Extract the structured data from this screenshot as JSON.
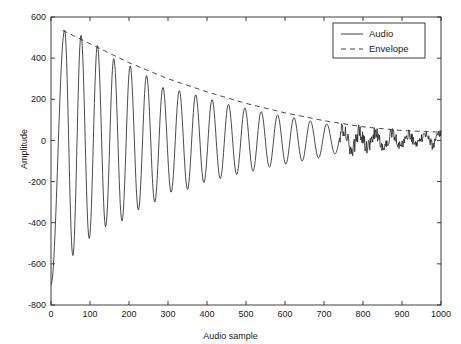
{
  "chart_data": {
    "type": "line",
    "title": "",
    "xlabel": "Audio sample",
    "ylabel": "Amplitude",
    "xlim": [
      0,
      1000
    ],
    "ylim": [
      -800,
      600
    ],
    "xticks": [
      0,
      100,
      200,
      300,
      400,
      500,
      600,
      700,
      800,
      900,
      1000
    ],
    "yticks": [
      -800,
      -600,
      -400,
      -200,
      0,
      200,
      400,
      600
    ],
    "grid": false,
    "legend_position": "upper right",
    "series": [
      {
        "name": "Audio",
        "style": "solid",
        "color": "#2a2a2a",
        "description": "Exponentially damped oscillation, period about 42 samples, starting near -700 at sample 0, first positive peak about 535 near sample 35, decaying to a low-amplitude noisy tail of roughly plus/minus 30 after sample 760",
        "peaks": [
          {
            "x": 35,
            "y": 535
          },
          {
            "x": 77,
            "y": 512
          },
          {
            "x": 119,
            "y": 462
          },
          {
            "x": 161,
            "y": 398
          },
          {
            "x": 203,
            "y": 363
          },
          {
            "x": 245,
            "y": 315
          },
          {
            "x": 287,
            "y": 258
          },
          {
            "x": 329,
            "y": 242
          },
          {
            "x": 371,
            "y": 222
          },
          {
            "x": 413,
            "y": 198
          },
          {
            "x": 455,
            "y": 175
          },
          {
            "x": 497,
            "y": 158
          },
          {
            "x": 539,
            "y": 140
          },
          {
            "x": 581,
            "y": 124
          },
          {
            "x": 623,
            "y": 110
          },
          {
            "x": 665,
            "y": 95
          },
          {
            "x": 707,
            "y": 80
          },
          {
            "x": 749,
            "y": 62
          },
          {
            "x": 791,
            "y": 40
          },
          {
            "x": 833,
            "y": 35
          },
          {
            "x": 875,
            "y": 32
          },
          {
            "x": 917,
            "y": 30
          },
          {
            "x": 959,
            "y": 34
          },
          {
            "x": 995,
            "y": 40
          }
        ],
        "troughs": [
          {
            "x": 0,
            "y": -700
          },
          {
            "x": 56,
            "y": -560
          },
          {
            "x": 98,
            "y": -478
          },
          {
            "x": 140,
            "y": -420
          },
          {
            "x": 182,
            "y": -392
          },
          {
            "x": 224,
            "y": -338
          },
          {
            "x": 266,
            "y": -300
          },
          {
            "x": 308,
            "y": -252
          },
          {
            "x": 350,
            "y": -238
          },
          {
            "x": 392,
            "y": -205
          },
          {
            "x": 434,
            "y": -185
          },
          {
            "x": 476,
            "y": -165
          },
          {
            "x": 518,
            "y": -148
          },
          {
            "x": 560,
            "y": -130
          },
          {
            "x": 602,
            "y": -115
          },
          {
            "x": 644,
            "y": -100
          },
          {
            "x": 686,
            "y": -85
          },
          {
            "x": 728,
            "y": -66
          },
          {
            "x": 770,
            "y": -48
          },
          {
            "x": 812,
            "y": -34
          },
          {
            "x": 854,
            "y": -30
          },
          {
            "x": 896,
            "y": -28
          },
          {
            "x": 938,
            "y": -26
          },
          {
            "x": 980,
            "y": -24
          }
        ]
      },
      {
        "name": "Envelope",
        "style": "dashed",
        "color": "#2a2a2a",
        "description": "Smooth exponential decay curve tracing the positive peaks of the audio signal",
        "points": [
          {
            "x": 30,
            "y": 535
          },
          {
            "x": 100,
            "y": 470
          },
          {
            "x": 200,
            "y": 378
          },
          {
            "x": 300,
            "y": 300
          },
          {
            "x": 400,
            "y": 236
          },
          {
            "x": 500,
            "y": 180
          },
          {
            "x": 600,
            "y": 134
          },
          {
            "x": 700,
            "y": 96
          },
          {
            "x": 800,
            "y": 66
          },
          {
            "x": 900,
            "y": 48
          },
          {
            "x": 1000,
            "y": 40
          }
        ]
      }
    ]
  },
  "legend": {
    "items": [
      {
        "label": "Audio",
        "style": "solid"
      },
      {
        "label": "Envelope",
        "style": "dashed"
      }
    ]
  }
}
